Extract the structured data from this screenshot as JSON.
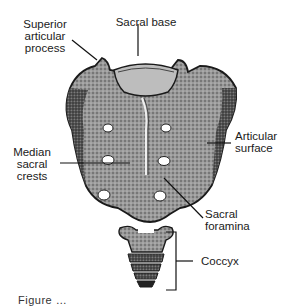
{
  "figure": {
    "labels": {
      "superior_articular_process": [
        "Superior",
        "articular",
        "process"
      ],
      "sacral_base": "Sacral base",
      "articular_surface": [
        "Articular",
        "surface"
      ],
      "median_sacral_crests": [
        "Median",
        "sacral",
        "crests"
      ],
      "sacral_foramina": [
        "Sacral",
        "foramina"
      ],
      "coccyx": "Coccyx"
    },
    "caption_partial": "Figure …"
  },
  "colors": {
    "bone_dark": "#2b2b2b",
    "bone_mid": "#7a7a7a",
    "bone_light": "#c8c8c8",
    "leader_line": "#111111",
    "background": "#ffffff"
  }
}
